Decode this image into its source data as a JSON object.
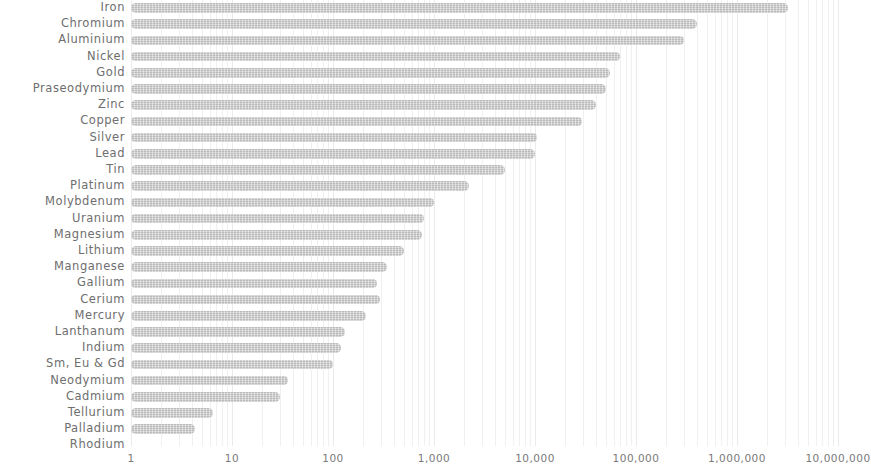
{
  "chart_data": {
    "type": "bar",
    "orientation": "horizontal",
    "title": "",
    "subtitle": "",
    "xlabel": "",
    "ylabel": "",
    "xscale": "log",
    "xlim": [
      1,
      10000000
    ],
    "grid": true,
    "legend": null,
    "bar_color": "#bcbcbc",
    "label_color": "#6e6e6e",
    "tick_labels": [
      "1",
      "10",
      "100",
      "1,000",
      "10,000",
      "100,000",
      "1,000,000",
      "10,000,000"
    ],
    "tick_values": [
      1,
      10,
      100,
      1000,
      10000,
      100000,
      1000000,
      10000000
    ],
    "categories": [
      "Iron",
      "Chromium",
      "Aluminium",
      "Nickel",
      "Gold",
      "Praseodymium",
      "Zinc",
      "Copper",
      "Silver",
      "Lead",
      "Tin",
      "Platinum",
      "Molybdenum",
      "Uranium",
      "Magnesium",
      "Lithium",
      "Manganese",
      "Gallium",
      "Cerium",
      "Mercury",
      "Lanthanum",
      "Indium",
      "Sm, Eu & Gd",
      "Neodymium",
      "Cadmium",
      "Tellurium",
      "Palladium",
      "Rhodium"
    ],
    "values": [
      3200000,
      400000,
      300000,
      70000,
      55000,
      50000,
      40000,
      29000,
      10500,
      10000,
      5000,
      2200,
      1000,
      800,
      760,
      500,
      340,
      270,
      290,
      210,
      130,
      120,
      100,
      36,
      30,
      6.5,
      4.3,
      1
    ]
  }
}
